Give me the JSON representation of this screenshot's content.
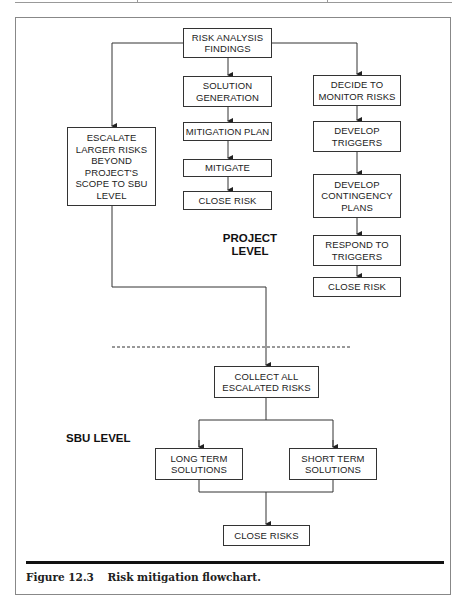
{
  "figure": {
    "number": "Figure 12.3",
    "title": "Risk mitigation flowchart."
  },
  "levels": {
    "project": "PROJECT\nLEVEL",
    "sbu": "SBU LEVEL"
  },
  "nodes": {
    "findings": "RISK ANALYSIS\nFINDINGS",
    "escalate": "ESCALATE\nLARGER RISKS\nBEYOND\nPROJECT'S\nSCOPE TO SBU\nLEVEL",
    "solution_generation": "SOLUTION\nGENERATION",
    "mitigation_plan": "MITIGATION PLAN",
    "mitigate": "MITIGATE",
    "close_risk_mid": "CLOSE RISK",
    "decide_monitor": "DECIDE TO\nMONITOR RISKS",
    "develop_triggers": "DEVELOP\nTRIGGERS",
    "develop_contingency": "DEVELOP\nCONTINGENCY\nPLANS",
    "respond_triggers": "RESPOND TO\nTRIGGERS",
    "close_risk_right": "CLOSE RISK",
    "collect_escalated": "COLLECT ALL\nESCALATED RISKS",
    "long_term": "LONG TERM\nSOLUTIONS",
    "short_term": "SHORT TERM\nSOLUTIONS",
    "close_risks": "CLOSE RISKS"
  },
  "edges": [
    [
      "findings",
      "escalate"
    ],
    [
      "findings",
      "solution_generation"
    ],
    [
      "findings",
      "decide_monitor"
    ],
    [
      "solution_generation",
      "mitigation_plan"
    ],
    [
      "mitigation_plan",
      "mitigate"
    ],
    [
      "mitigate",
      "close_risk_mid"
    ],
    [
      "decide_monitor",
      "develop_triggers"
    ],
    [
      "develop_triggers",
      "develop_contingency"
    ],
    [
      "develop_contingency",
      "respond_triggers"
    ],
    [
      "respond_triggers",
      "close_risk_right"
    ],
    [
      "escalate",
      "collect_escalated"
    ],
    [
      "collect_escalated",
      "long_term"
    ],
    [
      "collect_escalated",
      "short_term"
    ],
    [
      "long_term",
      "close_risks"
    ],
    [
      "short_term",
      "close_risks"
    ]
  ]
}
